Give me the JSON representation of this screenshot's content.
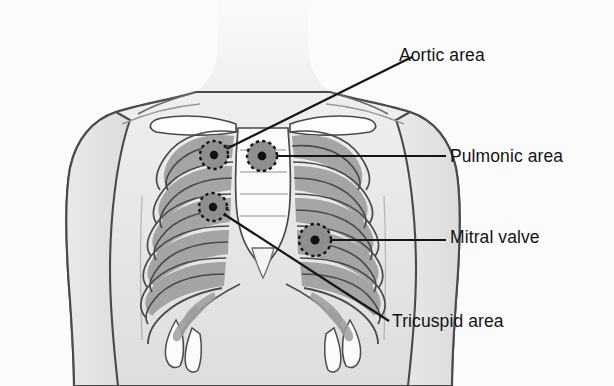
{
  "figure": {
    "background_color": "#fbfbfb",
    "line_color": "#141414",
    "skin_fill": "#e8e8e8",
    "bone_fill": "#fdfdfd",
    "intercostal_fill": "#a9a9a9",
    "marker_fill": "#8f8f8f",
    "marker_dash_color": "#111111"
  },
  "labels": {
    "aortic": "Aortic area",
    "pulmonic": "Pulmonic area",
    "mitral": "Mitral valve",
    "tricuspid": "Tricuspid area"
  },
  "markers": [
    {
      "name": "aortic",
      "cx": 214,
      "cy": 155,
      "r": 14
    },
    {
      "name": "pulmonic",
      "cx": 262,
      "cy": 156,
      "r": 15
    },
    {
      "name": "tricuspid",
      "cx": 213,
      "cy": 207,
      "r": 14
    },
    {
      "name": "mitral",
      "cx": 315,
      "cy": 240,
      "r": 16
    }
  ],
  "leader_lines": [
    {
      "name": "aortic",
      "x1": 214,
      "y1": 155,
      "x2": 412,
      "y2": 57
    },
    {
      "name": "pulmonic",
      "x1": 262,
      "y1": 156,
      "x2": 446,
      "y2": 156
    },
    {
      "name": "mitral",
      "x1": 315,
      "y1": 240,
      "x2": 446,
      "y2": 240
    },
    {
      "name": "tricuspid",
      "x1": 213,
      "y1": 207,
      "x2": 389,
      "y2": 321
    }
  ]
}
